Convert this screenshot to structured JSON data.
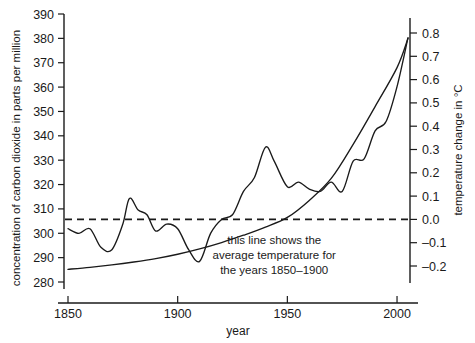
{
  "chart_data": {
    "type": "line",
    "title": "",
    "xlabel": "year",
    "ylabel": "concentration of carbon dioxide in parts per million",
    "y2label": "temperature change in °C",
    "grid": false,
    "legend": "none",
    "xlim": [
      1850,
      2005
    ],
    "xticks": [
      1850,
      1900,
      1950,
      2000
    ],
    "xtick_labels": [
      "1850",
      "1900",
      "1950",
      "2000"
    ],
    "ylim": [
      280,
      390
    ],
    "yticks": [
      280,
      290,
      300,
      310,
      320,
      330,
      340,
      350,
      360,
      370,
      380,
      390
    ],
    "ytick_labels": [
      "280",
      "290",
      "300",
      "310",
      "320",
      "330",
      "340",
      "350",
      "360",
      "370",
      "380",
      "390"
    ],
    "y2lim": [
      -0.25,
      0.85
    ],
    "y2ticks": [
      -0.2,
      -0.1,
      0.0,
      0.1,
      0.2,
      0.3,
      0.4,
      0.5,
      0.6,
      0.7,
      0.8
    ],
    "y2tick_labels": [
      "–0.2",
      "–0.1",
      "0.0",
      "0.1",
      "0.2",
      "0.3",
      "0.4",
      "0.5",
      "0.6",
      "0.7",
      "0.8"
    ],
    "series": [
      {
        "name": "carbon dioxide concentration",
        "axis": "left",
        "units": "ppm",
        "x": [
          1850,
          1860,
          1870,
          1880,
          1890,
          1900,
          1910,
          1920,
          1930,
          1940,
          1950,
          1960,
          1970,
          1980,
          1990,
          2000,
          2005
        ],
        "values": [
          285.2,
          286.0,
          287.0,
          288.2,
          289.6,
          291.4,
          293.6,
          296.2,
          299.2,
          302.5,
          306.5,
          313.5,
          322.5,
          336.5,
          352.0,
          368.0,
          380.0
        ]
      },
      {
        "name": "temperature change",
        "axis": "right",
        "units": "°C",
        "x": [
          1850,
          1855,
          1860,
          1865,
          1870,
          1875,
          1878,
          1882,
          1886,
          1890,
          1895,
          1900,
          1905,
          1910,
          1915,
          1920,
          1925,
          1930,
          1935,
          1940,
          1944,
          1950,
          1955,
          1960,
          1965,
          1970,
          1975,
          1980,
          1985,
          1990,
          1995,
          2000,
          2005
        ],
        "values": [
          -0.04,
          -0.06,
          -0.04,
          -0.12,
          -0.13,
          -0.02,
          0.09,
          0.04,
          0.02,
          -0.05,
          -0.02,
          -0.04,
          -0.13,
          -0.18,
          -0.06,
          0.0,
          0.02,
          0.12,
          0.18,
          0.31,
          0.25,
          0.14,
          0.16,
          0.13,
          0.12,
          0.16,
          0.12,
          0.25,
          0.26,
          0.38,
          0.42,
          0.57,
          0.78
        ]
      }
    ],
    "baseline": {
      "name": "average temperature for the years 1850–1900",
      "value": 0.0,
      "axis": "right",
      "style": "dashed"
    },
    "annotations": [
      {
        "name": "baseline-note",
        "lines": [
          "this line shows the",
          "average temperature for",
          "the years 1850–1900"
        ],
        "x": 1944,
        "y": -0.105
      }
    ]
  }
}
